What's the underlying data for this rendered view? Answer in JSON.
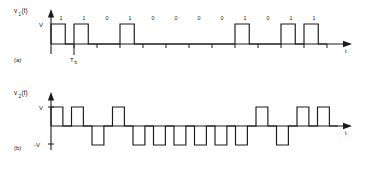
{
  "figure": {
    "panels": [
      {
        "id": "a",
        "panel_label": "(a)",
        "signal_label": "v",
        "signal_subscript": "1",
        "signal_arg": "(t)",
        "amplitude_label": "V",
        "time_axis_label": "t",
        "bit_period_label": "T",
        "bit_period_subscript": "b",
        "waveform_type": "unipolar-rz",
        "bits": [
          "1",
          "1",
          "0",
          "1",
          "0",
          "0",
          "0",
          "0",
          "1",
          "0",
          "1",
          "1"
        ]
      },
      {
        "id": "b",
        "panel_label": "(b)",
        "signal_label": "v",
        "signal_subscript": "2",
        "signal_arg": "(t)",
        "amplitude_label": "V",
        "negative_amplitude_label": "-V",
        "time_axis_label": "t",
        "waveform_type": "polar-rz",
        "levels": [
          "+",
          "+",
          "-",
          "+",
          "-",
          "-",
          "-",
          "-",
          "-",
          "-",
          "+",
          "-",
          "+",
          "+"
        ]
      }
    ]
  },
  "chart_data": {
    "type": "line",
    "xlabel": "t",
    "ylabel": "v(t)",
    "series": [
      {
        "name": "v1(t)",
        "panel": "(a)",
        "description": "Unipolar return-to-zero pulse train; 1 = pulse of amplitude V, 0 = no pulse",
        "ylim": [
          0,
          1
        ],
        "ytick_labels": [
          "V"
        ],
        "categories": [
          "1",
          "2",
          "3",
          "4",
          "5",
          "6",
          "7",
          "8",
          "9",
          "10",
          "11",
          "12"
        ],
        "values": [
          1,
          1,
          0,
          1,
          0,
          0,
          0,
          0,
          1,
          0,
          1,
          1
        ]
      },
      {
        "name": "v2(t)",
        "panel": "(b)",
        "description": "Polar return-to-zero pulse train; 1 = +V pulse, 0 = -V pulse",
        "ylim": [
          -1,
          1
        ],
        "ytick_labels": [
          "V",
          "-V"
        ],
        "categories": [
          "1",
          "2",
          "3",
          "4",
          "5",
          "6",
          "7",
          "8",
          "9",
          "10",
          "11",
          "12",
          "13",
          "14"
        ],
        "values": [
          1,
          1,
          -1,
          1,
          -1,
          -1,
          -1,
          -1,
          -1,
          -1,
          1,
          -1,
          1,
          1
        ]
      }
    ],
    "grid": false,
    "legend": "none"
  },
  "colors": {
    "ink": "#1a1a1a",
    "background": "#ffffff"
  }
}
